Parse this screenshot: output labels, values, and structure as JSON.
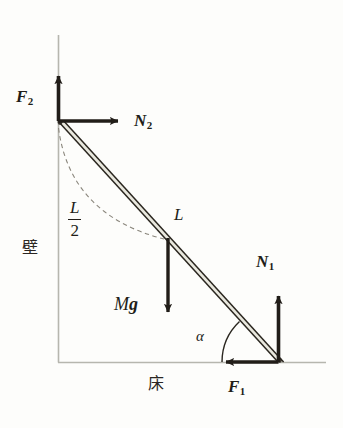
{
  "figure": {
    "type": "free-body-diagram",
    "background_color": "#fdfdfb",
    "ink_color": "#211d18",
    "structure_line_color": "#b6b6ae",
    "beam_fill_color": "#e9e8de"
  },
  "labels": {
    "f2": {
      "symbol": "F",
      "subscript": "2"
    },
    "n2": {
      "symbol": "N",
      "subscript": "2"
    },
    "n1": {
      "symbol": "N",
      "subscript": "1"
    },
    "f1": {
      "symbol": "F",
      "subscript": "1"
    },
    "length_l": "L",
    "half_length_numerator": "L",
    "half_length_denominator": "2",
    "weight_m": "M",
    "weight_g": "g",
    "angle": "α",
    "wall": "壁",
    "floor": "床"
  },
  "geometry": {
    "wall_x": 58,
    "wall_top_y": 35,
    "floor_y": 362,
    "floor_right_x": 326,
    "ladder_top": {
      "x": 58,
      "y": 121
    },
    "ladder_bottom": {
      "x": 278,
      "y": 362
    },
    "ladder_midpoint": {
      "x": 168,
      "y": 241
    },
    "angle_alpha_degrees": 47
  },
  "vectors": [
    {
      "name": "F2",
      "origin": {
        "x": 58,
        "y": 121
      },
      "tip": {
        "x": 58,
        "y": 70
      },
      "direction": "up"
    },
    {
      "name": "N2",
      "origin": {
        "x": 58,
        "y": 121
      },
      "tip": {
        "x": 124,
        "y": 121
      },
      "direction": "right"
    },
    {
      "name": "Mg",
      "origin": {
        "x": 168,
        "y": 238
      },
      "tip": {
        "x": 168,
        "y": 318
      },
      "direction": "down"
    },
    {
      "name": "N1",
      "origin": {
        "x": 278,
        "y": 362
      },
      "tip": {
        "x": 278,
        "y": 290
      },
      "direction": "up"
    },
    {
      "name": "F1",
      "origin": {
        "x": 278,
        "y": 362
      },
      "tip": {
        "x": 220,
        "y": 362
      },
      "direction": "left"
    }
  ]
}
